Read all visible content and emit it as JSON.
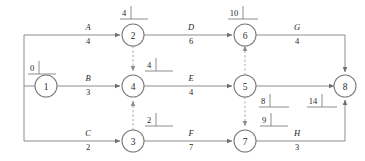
{
  "diagram": {
    "colors": {
      "background": "#ffffff",
      "line": "#8d8d8d",
      "dashed_line": "#a8a8a8",
      "node_stroke": "#7d7d7d",
      "text": "#1f1f1f"
    },
    "nodes": [
      {
        "id": "n1",
        "label": "1",
        "cx": 46,
        "cy": 86,
        "r": 11
      },
      {
        "id": "n2",
        "label": "2",
        "cx": 133,
        "cy": 35,
        "r": 11
      },
      {
        "id": "n3",
        "label": "3",
        "cx": 133,
        "cy": 141,
        "r": 11
      },
      {
        "id": "n4",
        "label": "4",
        "cx": 133,
        "cy": 86,
        "r": 11
      },
      {
        "id": "n5",
        "label": "5",
        "cx": 245,
        "cy": 86,
        "r": 11
      },
      {
        "id": "n6",
        "label": "6",
        "cx": 245,
        "cy": 35,
        "r": 11
      },
      {
        "id": "n7",
        "label": "7",
        "cx": 245,
        "cy": 141,
        "r": 11
      },
      {
        "id": "n8",
        "label": "8",
        "cx": 345,
        "cy": 86,
        "r": 11
      }
    ],
    "edges": [
      {
        "id": "A",
        "name": "A",
        "duration": "4",
        "from": "1",
        "to": "2",
        "style": "solid",
        "label_x": 88,
        "name_y": 27,
        "dur_y": 41
      },
      {
        "id": "B",
        "name": "B",
        "duration": "3",
        "from": "1",
        "to": "4",
        "style": "solid",
        "label_x": 88,
        "name_y": 78,
        "dur_y": 92
      },
      {
        "id": "C",
        "name": "C",
        "duration": "2",
        "from": "1",
        "to": "3",
        "style": "solid",
        "label_x": 88,
        "name_y": 133,
        "dur_y": 147
      },
      {
        "id": "D",
        "name": "D",
        "duration": "6",
        "from": "2",
        "to": "6",
        "style": "solid",
        "label_x": 191,
        "name_y": 27,
        "dur_y": 41
      },
      {
        "id": "E",
        "name": "E",
        "duration": "4",
        "from": "4",
        "to": "5",
        "style": "solid",
        "label_x": 191,
        "name_y": 78,
        "dur_y": 92
      },
      {
        "id": "F",
        "name": "F",
        "duration": "7",
        "from": "3",
        "to": "7",
        "style": "solid",
        "label_x": 191,
        "name_y": 133,
        "dur_y": 147
      },
      {
        "id": "G",
        "name": "G",
        "duration": "4",
        "from": "6",
        "to": "8",
        "style": "solid",
        "label_x": 297,
        "name_y": 27,
        "dur_y": 41
      },
      {
        "id": "H",
        "name": "H",
        "duration": "3",
        "from": "7",
        "to": "8",
        "style": "solid",
        "label_x": 297,
        "name_y": 133,
        "dur_y": 147
      }
    ],
    "dummy_edges": [
      {
        "id": "d2-4",
        "from": "2",
        "to": "4",
        "style": "dashed"
      },
      {
        "id": "d3-4",
        "from": "3",
        "to": "4",
        "style": "dashed"
      },
      {
        "id": "d5-6",
        "from": "5",
        "to": "6",
        "style": "dashed"
      },
      {
        "id": "d5-7",
        "from": "5",
        "to": "7",
        "style": "dashed"
      }
    ],
    "event_times": [
      {
        "id": "t1",
        "node": "1",
        "value": "0",
        "x": 32,
        "y": 68,
        "tick_x": 39,
        "line_x1": 28,
        "line_x2": 56
      },
      {
        "id": "t2",
        "node": "2",
        "value": "4",
        "x": 124,
        "y": 13,
        "tick_x": 131,
        "line_x1": 120,
        "line_x2": 148
      },
      {
        "id": "t4",
        "node": "4",
        "value": "4",
        "x": 149,
        "y": 65,
        "tick_x": 156,
        "line_x1": 145,
        "line_x2": 173
      },
      {
        "id": "t3",
        "node": "3",
        "value": "2",
        "x": 149,
        "y": 120,
        "tick_x": 156,
        "line_x1": 145,
        "line_x2": 173
      },
      {
        "id": "t6",
        "node": "6",
        "value": "10",
        "x": 234,
        "y": 13,
        "tick_x": 243,
        "line_x1": 228,
        "line_x2": 258
      },
      {
        "id": "t5",
        "node": "5",
        "value": "8",
        "x": 263,
        "y": 101,
        "tick_x": 270,
        "line_x1": 259,
        "line_x2": 289
      },
      {
        "id": "t7",
        "node": "7",
        "value": "9",
        "x": 264,
        "y": 120,
        "tick_x": 271,
        "line_x1": 260,
        "line_x2": 288
      },
      {
        "id": "t8",
        "node": "8",
        "value": "14",
        "x": 313,
        "y": 101,
        "tick_x": 322,
        "line_x1": 307,
        "line_x2": 337
      }
    ]
  }
}
